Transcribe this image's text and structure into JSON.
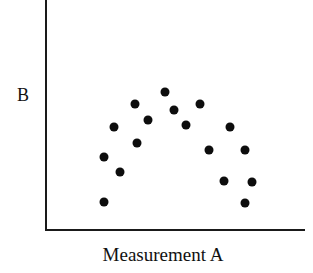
{
  "chart_data": {
    "type": "scatter",
    "title": "",
    "xlabel": "Measurement A",
    "ylabel": "B",
    "grid": false,
    "legend": null,
    "axis_tick_labels": {
      "x": [],
      "y": []
    },
    "xlim": [
      0,
      100
    ],
    "ylim": [
      0,
      100
    ],
    "series": [
      {
        "name": "observations",
        "marker": "filled-circle",
        "color": "#0d0d0d",
        "points": [
          {
            "x": 22.7,
            "y": 20.2
          },
          {
            "x": 22.7,
            "y": 52.0
          },
          {
            "x": 28.8,
            "y": 39.1
          },
          {
            "x": 22.7,
            "y": 65.1
          },
          {
            "x": 34.6,
            "y": 72.2
          },
          {
            "x": 39.6,
            "y": 86.1
          },
          {
            "x": 46.2,
            "y": 79.0
          },
          {
            "x": 53.1,
            "y": 92.6
          },
          {
            "x": 67.3,
            "y": 86.1
          },
          {
            "x": 63.1,
            "y": 78.0
          },
          {
            "x": 80.0,
            "y": 78.0
          },
          {
            "x": 62.1,
            "y": 67.0
          },
          {
            "x": 84.2,
            "y": 67.0
          },
          {
            "x": 68.8,
            "y": 53.0
          },
          {
            "x": 79.6,
            "y": 52.6
          },
          {
            "x": 80.0,
            "y": 43.5
          },
          {
            "x": 55.0,
            "y": 88.0
          }
        ],
        "pixel_points": [
          {
            "px": 104,
            "py": 202
          },
          {
            "px": 104,
            "py": 157
          },
          {
            "px": 120,
            "py": 172
          },
          {
            "px": 114,
            "py": 127
          },
          {
            "px": 137,
            "py": 143
          },
          {
            "px": 135,
            "py": 104
          },
          {
            "px": 148,
            "py": 120
          },
          {
            "px": 165,
            "py": 92
          },
          {
            "px": 200,
            "py": 104
          },
          {
            "px": 186,
            "py": 125
          },
          {
            "px": 230,
            "py": 127
          },
          {
            "px": 209,
            "py": 150
          },
          {
            "px": 245,
            "py": 150
          },
          {
            "px": 224,
            "py": 181
          },
          {
            "px": 252,
            "py": 182
          },
          {
            "px": 245,
            "py": 203
          },
          {
            "px": 174,
            "py": 110
          }
        ]
      }
    ]
  },
  "figure": {
    "background_color": "#ffffff",
    "axis_color": "#1a1a1a",
    "marker_color": "#0d0d0d"
  },
  "labels": {
    "x_axis": "Measurement A",
    "y_axis": "B"
  }
}
